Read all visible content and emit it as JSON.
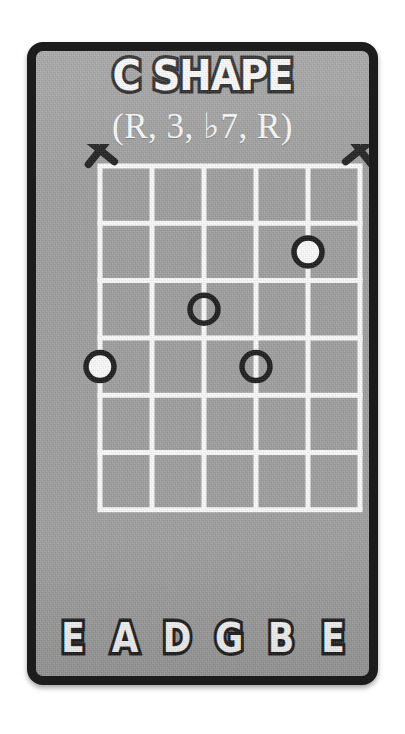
{
  "card": {
    "background_color": "#a0a0a0",
    "border_color": "#1c1c1c",
    "title": "C SHAPE",
    "subtitle": "(R, 3, ♭7, R)"
  },
  "diagram": {
    "type": "guitar-chord-diagram",
    "string_count": 6,
    "fret_count": 6,
    "line_color": "#ffffff",
    "marker_ring_color": "#1b1b1b",
    "marker_fill_root": "#ffffff",
    "string_labels": [
      "E",
      "A",
      "D",
      "G",
      "B",
      "E"
    ],
    "muted_strings": [
      1,
      6
    ],
    "muted_marker_glyph": "X",
    "notes": [
      {
        "string": 5,
        "fret": 2,
        "filled": true,
        "degree": "R"
      },
      {
        "string": 3,
        "fret": 3,
        "filled": false,
        "degree": "3"
      },
      {
        "string": 4,
        "fret": 4,
        "filled": false,
        "degree": "♭7"
      },
      {
        "string": 1,
        "fret": 4,
        "filled": true,
        "degree": "R"
      }
    ]
  },
  "chart_data": {
    "type": "table",
    "title": "C SHAPE",
    "subtitle": "(R, 3, ♭7, R)",
    "categories": [
      "E",
      "A",
      "D",
      "G",
      "B",
      "E"
    ],
    "series": [
      {
        "name": "fret",
        "values": [
          4,
          null,
          3,
          4,
          2,
          null
        ]
      },
      {
        "name": "marker",
        "values": [
          "filled",
          "muted",
          "hollow",
          "hollow",
          "filled",
          "muted"
        ]
      }
    ],
    "xlabel": "string",
    "ylabel": "fret",
    "ylim": [
      0,
      6
    ]
  }
}
